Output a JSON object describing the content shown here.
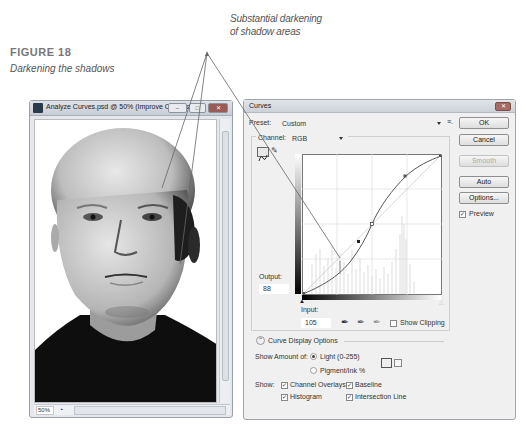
{
  "callout": {
    "line1": "Substantial darkening",
    "line2": "of shadow areas"
  },
  "figure": {
    "number": "FIGURE 18",
    "title": "Darkening the shadows"
  },
  "document_window": {
    "title": "Analyze Curves.psd @ 50% (Improve Contras...",
    "buttons": [
      "minimize",
      "maximize",
      "close"
    ],
    "status": {
      "zoom": "50%"
    }
  },
  "curves_dialog": {
    "title": "Curves",
    "preset_label": "Preset:",
    "preset_value": "Custom",
    "channel_label": "Channel:",
    "channel_value": "RGB",
    "buttons": {
      "ok": "OK",
      "cancel": "Cancel",
      "smooth": "Smooth",
      "auto": "Auto",
      "options": "Options..."
    },
    "preview": {
      "label": "Preview",
      "checked": true
    },
    "output_label": "Output:",
    "output_value": "88",
    "input_label": "Input:",
    "input_value": "105",
    "show_clipping": {
      "label": "Show Clipping",
      "checked": false
    },
    "curve_display_options": "Curve Display Options",
    "show_amount_label": "Show Amount of:",
    "show_amount_options": [
      {
        "label": "Light  (0-255)",
        "selected": true
      },
      {
        "label": "Pigment/Ink %",
        "selected": false
      }
    ],
    "show_label": "Show:",
    "show_options": [
      {
        "label": "Channel Overlays",
        "checked": true
      },
      {
        "label": "Baseline",
        "checked": true
      },
      {
        "label": "Histogram",
        "checked": true
      },
      {
        "label": "Intersection Line",
        "checked": true
      }
    ],
    "curve_points": [
      [
        0,
        0
      ],
      [
        70,
        58
      ],
      [
        105,
        88
      ],
      [
        128,
        128
      ],
      [
        192,
        212
      ],
      [
        255,
        255
      ]
    ],
    "colors": {
      "close_button": "#a86a64",
      "dialog_bg": "#f0f0f0"
    }
  }
}
